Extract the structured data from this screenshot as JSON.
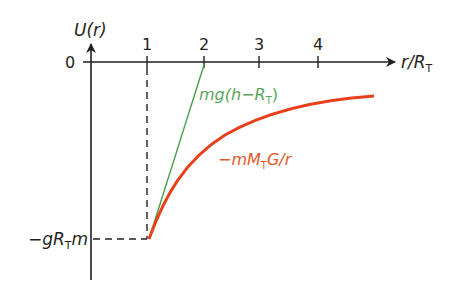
{
  "diagram": {
    "y_axis_label": {
      "main": "U(r)"
    },
    "x_axis_label": {
      "main": "r/R",
      "sub": "T"
    },
    "origin_label": "0",
    "x_ticks": [
      "1",
      "2",
      "3",
      "4"
    ],
    "y_min_label": {
      "pre": "−gR",
      "sub": "T",
      "post": "m"
    },
    "green_line_label": {
      "pre": "mg(h−R",
      "sub": "T",
      "post": ")"
    },
    "red_curve_label": {
      "pre": "−mM",
      "sub": "T",
      "post": "G/r"
    },
    "colors": {
      "axis": "#231f20",
      "green": "#4aa04a",
      "green_text": "#5aa55a",
      "red": "#e8401c",
      "red_text": "#e05a2a"
    }
  }
}
